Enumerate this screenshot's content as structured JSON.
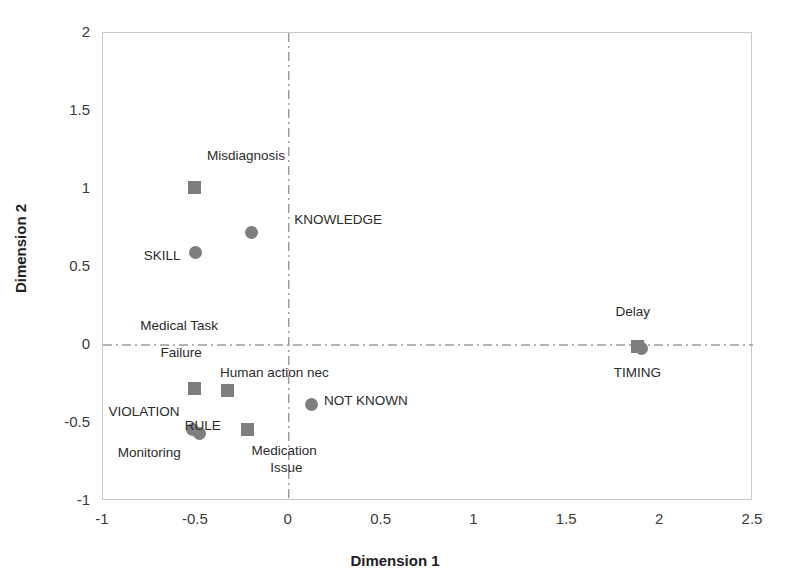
{
  "chart_data": {
    "type": "scatter",
    "title": "",
    "xlabel": "Dimension 1",
    "ylabel": "Dimension 2",
    "xlim": [
      -1,
      2.5
    ],
    "ylim": [
      -1,
      2
    ],
    "xticks": [
      "-1",
      "-0.5",
      "0",
      "0.5",
      "1",
      "1.5",
      "2",
      "2.5"
    ],
    "xtick_values": [
      -1,
      -0.5,
      0,
      0.5,
      1,
      1.5,
      2,
      2.5
    ],
    "yticks": [
      "2",
      "1.5",
      "1",
      "0.5",
      "0",
      "-0.5",
      "-1"
    ],
    "ytick_values": [
      2,
      1.5,
      1,
      0.5,
      0,
      -0.5,
      -1
    ],
    "grid": false,
    "legend": "none",
    "reference_lines": {
      "vertical_x": 0,
      "horizontal_y": 0,
      "style": "dash-dot",
      "color": "#9a9a9a"
    },
    "marker_color": "#7e7e7e",
    "series": [
      {
        "name": "Squares",
        "marker": "square",
        "points": [
          {
            "label": "Misdiagnosis",
            "x": -0.51,
            "y": 1.01
          },
          {
            "label": "Medical Task Failure",
            "x": -0.51,
            "y": -0.28
          },
          {
            "label": "Human action nec",
            "x": -0.33,
            "y": -0.29
          },
          {
            "label": "Medication Issue",
            "x": -0.22,
            "y": -0.54
          },
          {
            "label": "TIMING",
            "x": 1.88,
            "y": -0.01
          }
        ]
      },
      {
        "name": "Circles",
        "marker": "circle",
        "points": [
          {
            "label": "KNOWLEDGE",
            "x": -0.2,
            "y": 0.72
          },
          {
            "label": "SKILL",
            "x": -0.5,
            "y": 0.59
          },
          {
            "label": "VIOLATION",
            "x": -0.52,
            "y": -0.54
          },
          {
            "label": "Monitoring",
            "x": -0.48,
            "y": -0.57
          },
          {
            "label": "NOT KNOWN",
            "x": 0.12,
            "y": -0.38
          },
          {
            "label": "Delay",
            "x": 1.9,
            "y": -0.02
          }
        ]
      }
    ],
    "annotations": [
      {
        "text": "Misdiagnosis",
        "x": -0.44,
        "y": 1.21
      },
      {
        "text": "KNOWLEDGE",
        "x": 0.03,
        "y": 0.8
      },
      {
        "text": "SKILL",
        "x": -0.78,
        "y": 0.57
      },
      {
        "text": "Medical Task",
        "x": -0.8,
        "y": 0.12
      },
      {
        "text": "Failure",
        "x": -0.69,
        "y": -0.05
      },
      {
        "text": "Human action nec",
        "x": -0.37,
        "y": -0.18
      },
      {
        "text": "VIOLATION",
        "x": -0.97,
        "y": -0.43
      },
      {
        "text": "RULE",
        "x": -0.56,
        "y": -0.52
      },
      {
        "text": "NOT KNOWN",
        "x": 0.19,
        "y": -0.36
      },
      {
        "text": "Monitoring",
        "x": -0.92,
        "y": -0.69
      },
      {
        "text": "Medication",
        "x": -0.2,
        "y": -0.68
      },
      {
        "text": "Issue",
        "x": -0.1,
        "y": -0.79
      },
      {
        "text": "Delay",
        "x": 1.76,
        "y": 0.21
      },
      {
        "text": "TIMING",
        "x": 1.75,
        "y": -0.18
      }
    ]
  }
}
